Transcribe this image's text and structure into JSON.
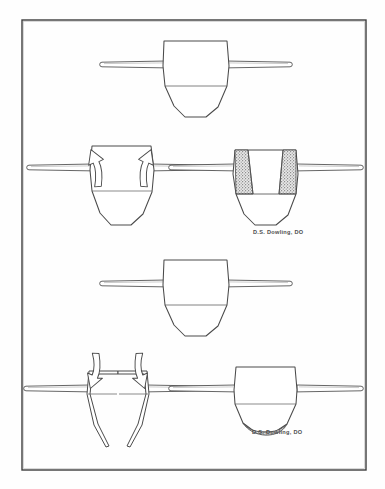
{
  "plate": {
    "title": "Sacral mechanics line drawing plate",
    "background_color": "#fefefe",
    "frame": {
      "name": "plate-border",
      "x": 22,
      "y": 20,
      "width": 344,
      "height": 450,
      "stroke": "#3d3d3d",
      "stroke_width": 1.4
    },
    "ink_color": "#4a4a4a",
    "shade_color": "#9b9b9b",
    "shade_fill": "#a8a8a8"
  },
  "signatures": [
    {
      "name": "signature-upper",
      "text": "D.S. Dowling, DO",
      "x": 253,
      "y": 231
    },
    {
      "name": "signature-lower",
      "text": "D.S. Dowling, DO",
      "x": 252,
      "y": 431
    }
  ],
  "panels": [
    {
      "id": "panel-1",
      "name": "panel-neutral-upper",
      "label": "neutral sacrum with transverse axis rods",
      "center_x": 196,
      "top_y": 41,
      "has_arrows": false,
      "shading": "none",
      "split": false
    },
    {
      "id": "panel-2",
      "name": "panel-flexion-arrows",
      "label": "sacrum with paired upward curved arrows",
      "center_x": 122,
      "top_y": 141,
      "has_arrows": true,
      "arrow_direction": "up",
      "shading": "none",
      "split": false
    },
    {
      "id": "panel-3",
      "name": "panel-wedge-shading",
      "label": "sacrum with stippled superior wedges",
      "center_x": 266,
      "top_y": 148,
      "has_arrows": false,
      "shading": "superior-wedges",
      "split": false
    },
    {
      "id": "panel-4",
      "name": "panel-neutral-lower",
      "label": "neutral sacrum with transverse axis rods",
      "center_x": 196,
      "top_y": 260,
      "has_arrows": false,
      "shading": "none",
      "split": false
    },
    {
      "id": "panel-5",
      "name": "panel-extension-arrows",
      "label": "split sacrum with paired downward curved arrows",
      "center_x": 118,
      "top_y": 363,
      "has_arrows": true,
      "arrow_direction": "down",
      "shading": "none",
      "split": true
    },
    {
      "id": "panel-6",
      "name": "panel-crescent-shading",
      "label": "sacrum with inferior crescent shading",
      "center_x": 266,
      "top_y": 363,
      "has_arrows": false,
      "shading": "inferior-crescent",
      "split": false
    }
  ]
}
